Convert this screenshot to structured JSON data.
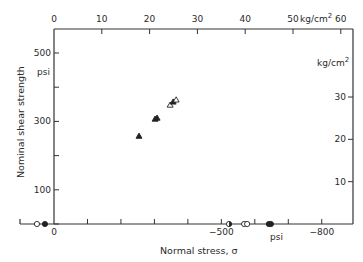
{
  "chart_data": {
    "type": "scatter",
    "title": "",
    "xlabel": "Normal stress, σ",
    "ylabel": "Nominal shear strength",
    "x_unit_bottom": "psi",
    "y_unit_left": "psi",
    "x_unit_top": "kg/cm²",
    "y_unit_right": "kg/cm²",
    "xlim_psi": [
      0,
      -900
    ],
    "ylim_psi": [
      0,
      560
    ],
    "grid": false,
    "bottom_ticks": [
      {
        "v": 0,
        "label": "0"
      },
      {
        "v": -100,
        "label": ""
      },
      {
        "v": -200,
        "label": ""
      },
      {
        "v": -300,
        "label": ""
      },
      {
        "v": -400,
        "label": ""
      },
      {
        "v": -500,
        "label": "−500"
      },
      {
        "v": -600,
        "label": ""
      },
      {
        "v": -700,
        "label": ""
      },
      {
        "v": -800,
        "label": "−800"
      }
    ],
    "left_ticks": [
      {
        "v": 0,
        "label": ""
      },
      {
        "v": 100,
        "label": "100"
      },
      {
        "v": 200,
        "label": ""
      },
      {
        "v": 300,
        "label": "300"
      },
      {
        "v": 400,
        "label": ""
      },
      {
        "v": 500,
        "label": "500"
      }
    ],
    "top_ticks": [
      {
        "v": 0,
        "label": "0"
      },
      {
        "v": 10,
        "label": "10"
      },
      {
        "v": 20,
        "label": "20"
      },
      {
        "v": 30,
        "label": "30"
      },
      {
        "v": 40,
        "label": "40"
      },
      {
        "v": 50,
        "label": "50"
      },
      {
        "v": 60,
        "label": "60"
      }
    ],
    "right_ticks": [
      {
        "v": 10,
        "label": "10"
      },
      {
        "v": 20,
        "label": "20"
      },
      {
        "v": 30,
        "label": "30"
      }
    ],
    "series": [
      {
        "name": "shear failures (triangles)",
        "marker": "triangle",
        "points": [
          {
            "x": -254,
            "y": 257,
            "fill": "filled"
          },
          {
            "x": -302,
            "y": 307,
            "fill": "filled"
          },
          {
            "x": -308,
            "y": 310,
            "fill": "filled"
          },
          {
            "x": -347,
            "y": 348,
            "fill": "open"
          },
          {
            "x": -356,
            "y": 357,
            "fill": "filled"
          },
          {
            "x": -365,
            "y": 363,
            "fill": "open"
          }
        ]
      },
      {
        "name": "zero shear (circles)",
        "marker": "circle",
        "points": [
          {
            "x": 51,
            "y": 0,
            "fill": "open"
          },
          {
            "x": 27,
            "y": 0,
            "fill": "filled"
          },
          {
            "x": -523,
            "y": 0,
            "fill": "half"
          },
          {
            "x": -568,
            "y": 0,
            "fill": "open"
          },
          {
            "x": -577,
            "y": 0,
            "fill": "open"
          },
          {
            "x": -642,
            "y": 0,
            "fill": "filled"
          },
          {
            "x": -648,
            "y": 0,
            "fill": "filled"
          }
        ]
      }
    ]
  },
  "labels": {
    "xlabel": "Normal stress, σ",
    "ylabel": "Nominal shear strength",
    "psi_left": "psi",
    "psi_bottom": "psi",
    "kg_top": "kg/cm",
    "kg_top_sup": "2",
    "kg_right": "kg/cm",
    "kg_right_sup": "2"
  }
}
